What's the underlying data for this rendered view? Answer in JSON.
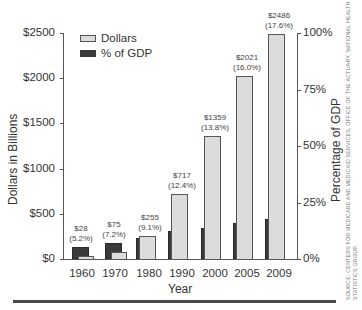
{
  "chart_data": {
    "type": "bar",
    "title": "",
    "xlabel": "Year",
    "ylabel": "Dollars in Billions",
    "ylabel_right": "Percentage of GDP",
    "categories": [
      "1960",
      "1970",
      "1980",
      "1990",
      "2000",
      "2005",
      "2009"
    ],
    "series": [
      {
        "name": "Dollars",
        "axis": "left",
        "color": "#dcdcdc",
        "values": [
          28,
          75,
          255,
          717,
          1359,
          2021,
          2486
        ]
      },
      {
        "name": "% of GDP",
        "axis": "right",
        "color": "#3a3a3a",
        "values": [
          5.2,
          7.2,
          9.1,
          12.4,
          13.8,
          16.0,
          17.6
        ]
      }
    ],
    "ylim": [
      0,
      2500
    ],
    "ylim_right": [
      0,
      100
    ],
    "yticks": [
      "$0",
      "$500",
      "$1000",
      "$1500",
      "$2000",
      "$2500"
    ],
    "yticks_right": [
      "0%",
      "25%",
      "50%",
      "75%",
      "100%"
    ],
    "bar_labels": [
      {
        "dollars": "$28",
        "pct": "(5.2%)"
      },
      {
        "dollars": "$75",
        "pct": "(7.2%)"
      },
      {
        "dollars": "$255",
        "pct": "(9.1%)"
      },
      {
        "dollars": "$717",
        "pct": "(12.4%)"
      },
      {
        "dollars": "$1359",
        "pct": "(13.8%)"
      },
      {
        "dollars": "$2021",
        "pct": "(16.0%)"
      },
      {
        "dollars": "$2486",
        "pct": "(17.6%)"
      }
    ],
    "legend": {
      "position": "upper left",
      "entries": [
        "Dollars",
        "% of GDP"
      ]
    },
    "grid": false
  },
  "source_note": {
    "line1": "SOURCE: CENTERS FOR MEDICARE AND MEDICAID SERVICES, OFFICE OF THE ACTUARY, NATIONAL HEALTH",
    "line2": "STATISTICS GROUP."
  }
}
